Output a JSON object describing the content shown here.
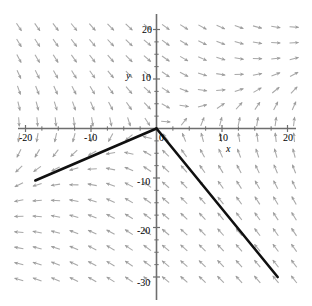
{
  "chart_data": {
    "type": "line",
    "title": "",
    "xlabel": "x",
    "ylabel": "y",
    "xlim": [
      -22,
      21.5
    ],
    "ylim": [
      -31.5,
      22
    ],
    "grid": false,
    "legend": "none",
    "x_ticks": [
      -20,
      -10,
      0,
      10,
      20
    ],
    "x_tick_labels": [
      "-20",
      "-10",
      "0",
      "10",
      "20"
    ],
    "y_ticks": [
      20,
      10,
      -10,
      -20,
      -30
    ],
    "y_tick_labels": [
      "20",
      "10",
      "-10",
      "-20",
      "-30"
    ],
    "minor_x_ticks": [
      -17.5,
      -15,
      -12.5,
      -7.5,
      -5,
      -2.5,
      2.5,
      5,
      7.5,
      12.5,
      15,
      17.5
    ],
    "minor_y_ticks": [
      17.5,
      15,
      12.5,
      7.5,
      5,
      2.5,
      -2.5,
      -5,
      -7.5,
      -12.5,
      -15,
      -17.5,
      -22.5,
      -25,
      -27.5
    ],
    "series": [
      {
        "name": "trajectory-left",
        "color": "#101010",
        "x": [
          0,
          -18.5
        ],
        "y": [
          0,
          -10.5
        ]
      },
      {
        "name": "trajectory-right",
        "color": "#101010",
        "x": [
          0,
          18.5
        ],
        "y": [
          0,
          -30.0
        ]
      }
    ],
    "vector_field": {
      "color": "#9a9a9a",
      "arrow_color": "#8a8a8a",
      "columns": 16,
      "rows": 17,
      "note": "Arrows point along the flow; upper-left quadrant arrows point down-right, lower-left arrows point left, lower-right arrows point down-right, upper-right arrows point right and up-right."
    },
    "axis_color": "#6e6e6e"
  },
  "figure": {
    "axis_labels": {
      "x": "x",
      "y": "y"
    }
  }
}
